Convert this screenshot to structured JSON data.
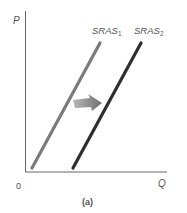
{
  "diagram": {
    "type": "supply-shift",
    "axes": {
      "y_label": "P",
      "x_label": "Q",
      "origin_label": "0"
    },
    "curves": [
      {
        "name": "SRAS",
        "subscript": "1",
        "color": "#7a7a7a"
      },
      {
        "name": "SRAS",
        "subscript": "2",
        "color": "#2e2e2e"
      }
    ],
    "shift_arrow": {
      "direction": "right",
      "color": "#8a8a8a"
    },
    "caption": "(a)"
  }
}
